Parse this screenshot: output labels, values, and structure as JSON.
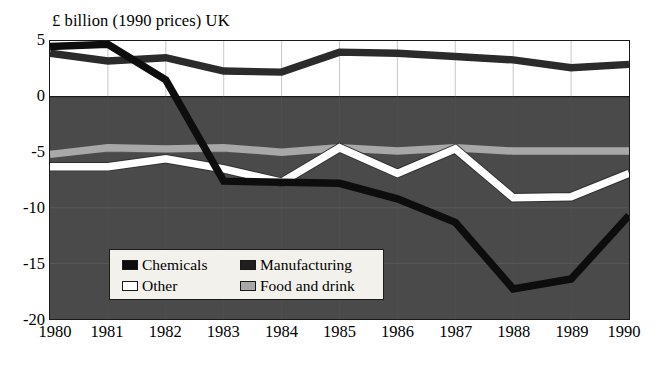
{
  "chart_data": {
    "type": "line",
    "title": "£ billion (1990 prices) UK",
    "xlabel": "",
    "ylabel": "",
    "categories": [
      "1980",
      "1981",
      "1982",
      "1983",
      "1984",
      "1985",
      "1986",
      "1987",
      "1988",
      "1989",
      "1990"
    ],
    "x": [
      1980,
      1981,
      1982,
      1983,
      1984,
      1985,
      1986,
      1987,
      1988,
      1989,
      1990
    ],
    "ylim": [
      -20,
      5
    ],
    "yticks": [
      5,
      0,
      -5,
      -10,
      -15,
      -20
    ],
    "ytick_labels": [
      "5",
      "0",
      "-5",
      "-10",
      "-15",
      "-20"
    ],
    "grid": true,
    "legend_position": "inside-bottom-left",
    "series": [
      {
        "name": "Chemicals",
        "color": "#0d0d0d",
        "values": [
          4.5,
          4.7,
          1.5,
          -7.6,
          -7.7,
          -7.8,
          -9.2,
          -11.3,
          -17.3,
          -16.4,
          -10.7
        ]
      },
      {
        "name": "Manufacturing",
        "color": "#2b2b2b",
        "values": [
          3.9,
          3.2,
          3.5,
          2.3,
          2.2,
          4.0,
          3.9,
          3.6,
          3.3,
          2.6,
          2.9
        ]
      },
      {
        "name": "Other",
        "color": "#ffffff",
        "values": [
          -6.3,
          -6.3,
          -5.6,
          -6.5,
          -7.7,
          -4.6,
          -6.9,
          -4.7,
          -9.1,
          -9.0,
          -6.9
        ]
      },
      {
        "name": "Food and drink",
        "color": "#a8a8a8",
        "values": [
          -5.2,
          -4.6,
          -4.7,
          -4.6,
          -5.0,
          -4.6,
          -4.9,
          -4.6,
          -4.9,
          -4.9,
          -4.9
        ]
      }
    ]
  },
  "legend": {
    "entries": [
      {
        "label": "Chemicals",
        "swatch": "#0d0d0d"
      },
      {
        "label": "Manufacturing",
        "swatch": "#1f1f1f"
      },
      {
        "label": "Other",
        "swatch": "#ffffff"
      },
      {
        "label": "Food and drink",
        "swatch": "#a8a8a8"
      }
    ]
  },
  "plot": {
    "background_positive": "#ffffff",
    "background_negative": "#4a4a4a",
    "frame_color": "#1a1a1a"
  }
}
